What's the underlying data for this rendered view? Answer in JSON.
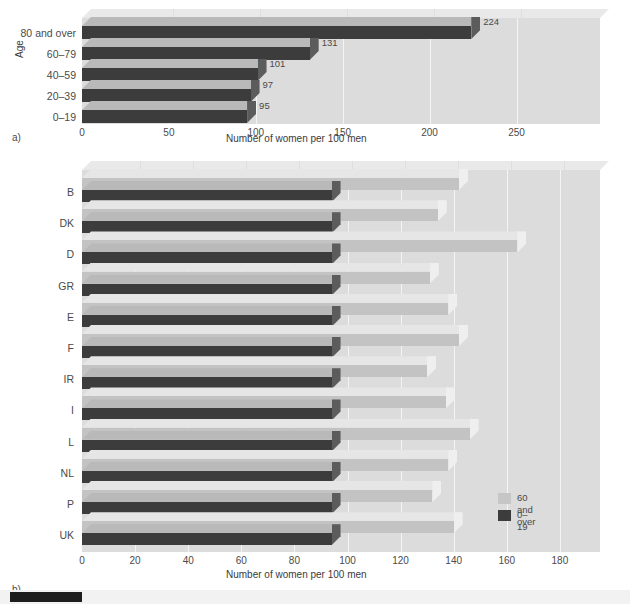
{
  "figure": {
    "panel_a_letter": "a)",
    "panel_b_letter": "b)",
    "legend": {
      "items": [
        {
          "label": "60 and over",
          "color": "#c6c6c6"
        },
        {
          "label": "0–19",
          "color": "#3c3c3c"
        }
      ]
    },
    "colors": {
      "plate": "#dcdcdc",
      "plate_top": "#e9e9e9",
      "bar_dark": "#3c3c3c",
      "bar_light": "#c3c3c3",
      "grid": "#f4f4f4",
      "text": "#4a4a4a"
    }
  },
  "chart_data": [
    {
      "type": "bar",
      "orientation": "horizontal",
      "panel": "a)",
      "title": "",
      "xlabel": "Number of women per 100 men",
      "ylabel": "Age",
      "xlim": [
        0,
        280
      ],
      "xticks": [
        0,
        50,
        100,
        150,
        200,
        250
      ],
      "grid": true,
      "legend_position": "none",
      "categories": [
        "0–19",
        "20–39",
        "40–59",
        "60–79",
        "80 and over"
      ],
      "category_order_top_to_bottom": [
        "80 and over",
        "60–79",
        "40–59",
        "20–39",
        "0–19"
      ],
      "values": [
        95,
        97,
        101,
        131,
        224
      ],
      "data_labels": [
        "95",
        "97",
        "101",
        "131",
        "224"
      ]
    },
    {
      "type": "bar",
      "orientation": "horizontal",
      "panel": "b)",
      "title": "",
      "xlabel": "Number of women per 100 men",
      "ylabel": "",
      "xlim": [
        0,
        196
      ],
      "xticks": [
        0,
        20,
        40,
        60,
        80,
        100,
        120,
        140,
        160,
        180
      ],
      "grid": true,
      "legend_position": "inner-bottom-right",
      "categories": [
        "B",
        "DK",
        "D",
        "GR",
        "E",
        "F",
        "IR",
        "I",
        "L",
        "NL",
        "P",
        "UK"
      ],
      "series": [
        {
          "name": "60 and over",
          "color": "#c3c3c3",
          "values": [
            142,
            134,
            164,
            131,
            138,
            142,
            130,
            137,
            146,
            138,
            132,
            140
          ]
        },
        {
          "name": "0–19",
          "color": "#3c3c3c",
          "values": [
            94,
            94,
            94,
            94,
            94,
            94,
            94,
            94,
            94,
            94,
            94,
            94
          ]
        }
      ]
    }
  ]
}
